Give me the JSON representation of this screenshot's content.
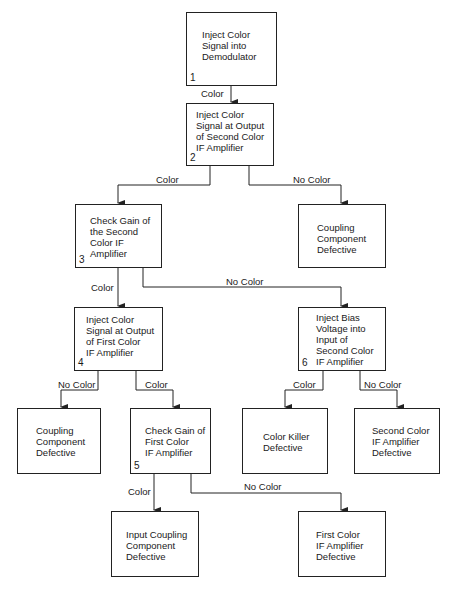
{
  "nodes": [
    {
      "id": "n1",
      "step": "1",
      "text": "Inject Color\nSignal into\nDemodulator"
    },
    {
      "id": "n2",
      "step": "2",
      "text": "Inject Color\nSignal at Output\nof Second Color\nIF Amplifier"
    },
    {
      "id": "n3",
      "step": "3",
      "text": "Check Gain of\nthe Second\nColor IF\nAmplifier"
    },
    {
      "id": "r1",
      "step": "",
      "text": "Coupling\nComponent\nDefective"
    },
    {
      "id": "n4",
      "step": "4",
      "text": "Inject Color\nSignal at Output\nof First Color\nIF Amplifier"
    },
    {
      "id": "n6",
      "step": "6",
      "text": "Inject Bias\nVoltage into\nInput of\nSecond Color\nIF Amplifier"
    },
    {
      "id": "r2",
      "step": "",
      "text": "Coupling\nComponent\nDefective"
    },
    {
      "id": "n5",
      "step": "5",
      "text": "Check Gain of\nFirst Color\nIF Amplifier"
    },
    {
      "id": "r3",
      "step": "",
      "text": "Color Killer\nDefective"
    },
    {
      "id": "r4",
      "step": "",
      "text": "Second Color\nIF Amplifier\nDefective"
    },
    {
      "id": "r5",
      "step": "",
      "text": "Input Coupling\nComponent\nDefective"
    },
    {
      "id": "r6",
      "step": "",
      "text": "First Color\nIF Amplifier\nDefective"
    }
  ],
  "edges": [
    {
      "from": "n1",
      "to": "n2",
      "label": "Color"
    },
    {
      "from": "n2",
      "to": "n3",
      "label": "Color"
    },
    {
      "from": "n2",
      "to": "r1",
      "label": "No Color"
    },
    {
      "from": "n3",
      "to": "n4",
      "label": "Color"
    },
    {
      "from": "n3",
      "to": "n6",
      "label": "No Color"
    },
    {
      "from": "n4",
      "to": "r2",
      "label": "No Color"
    },
    {
      "from": "n4",
      "to": "n5",
      "label": "Color"
    },
    {
      "from": "n6",
      "to": "r3",
      "label": "Color"
    },
    {
      "from": "n6",
      "to": "r4",
      "label": "No Color"
    },
    {
      "from": "n5",
      "to": "r5",
      "label": "Color"
    },
    {
      "from": "n5",
      "to": "r6",
      "label": "No Color"
    }
  ]
}
